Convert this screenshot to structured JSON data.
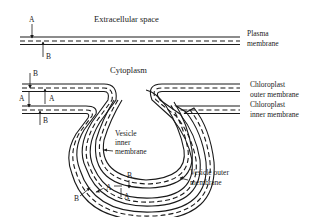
{
  "diagram": {
    "headings": {
      "extracellular": "Extracellular space",
      "cytoplasm": "Cytoplasm"
    },
    "labels": {
      "plasma_membrane": [
        "Plasma",
        "membrane"
      ],
      "chloroplast_outer": [
        "Chloroplast",
        "outer membrane"
      ],
      "chloroplast_inner": [
        "Chloroplast",
        "inner membrane"
      ],
      "vesicle_inner": [
        "Vesicle",
        "inner",
        "membrane"
      ],
      "vesicle_outer": [
        "Vesicle outer",
        "membrane"
      ]
    },
    "face_markers": {
      "A": "A",
      "B": "B"
    },
    "structures": [
      "plasma membrane (bilayer)",
      "chloroplast outer membrane",
      "chloroplast inner membrane",
      "vesicle inner membrane",
      "vesicle outer membrane"
    ]
  }
}
